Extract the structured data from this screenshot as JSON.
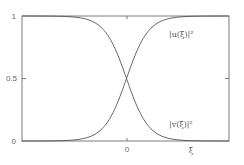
{
  "chart_data": {
    "type": "line",
    "title": "",
    "xlabel": "ξ",
    "ylabel": "",
    "xlim": [
      -4,
      4
    ],
    "ylim": [
      0,
      1
    ],
    "x_ticks": [
      {
        "value": 0,
        "label": "0"
      }
    ],
    "y_ticks": [
      {
        "value": 0,
        "label": "0"
      },
      {
        "value": 0.5,
        "label": "0.5"
      },
      {
        "value": 1,
        "label": "1"
      }
    ],
    "grid": false,
    "legend": "inline labels at right",
    "series": [
      {
        "name": "|u(ξ)|²",
        "x": [
          -4,
          -3,
          -2,
          -1.5,
          -1,
          -0.5,
          0,
          0.5,
          1,
          1.5,
          2,
          3,
          4
        ],
        "values": [
          0.0,
          0.0,
          0.02,
          0.05,
          0.12,
          0.27,
          0.5,
          0.73,
          0.88,
          0.95,
          0.98,
          1.0,
          1.0
        ]
      },
      {
        "name": "|v(ξ)|²",
        "x": [
          -4,
          -3,
          -2,
          -1.5,
          -1,
          -0.5,
          0,
          0.5,
          1,
          1.5,
          2,
          3,
          4
        ],
        "values": [
          1.0,
          1.0,
          0.98,
          0.95,
          0.88,
          0.73,
          0.5,
          0.27,
          0.12,
          0.05,
          0.02,
          0.0,
          0.0
        ]
      }
    ]
  },
  "labels": {
    "u": "|u(ξ)|²",
    "v": "|v(ξ)|²",
    "xlabel": "ξ",
    "y0": "0",
    "y05": "0.5",
    "y1": "1",
    "x0": "0"
  },
  "colors": {
    "frame": "#6e6e6e",
    "curve": "#555555"
  }
}
